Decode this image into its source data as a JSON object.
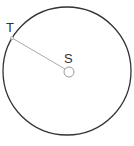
{
  "diagram": {
    "type": "circle-radius",
    "labels": {
      "center": "S",
      "point": "T"
    },
    "colors": {
      "circle": "#333333",
      "radius_line": "#aaaaaa",
      "center_marker": "#999999"
    }
  }
}
